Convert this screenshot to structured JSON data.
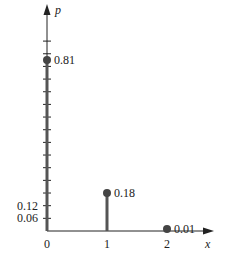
{
  "chart_data": {
    "type": "stem",
    "title": "",
    "xlabel": "x",
    "ylabel": "p",
    "x": [
      0,
      1,
      2
    ],
    "values": [
      0.81,
      0.18,
      0.01
    ],
    "value_labels": [
      "0.81",
      "0.18",
      "0.01"
    ],
    "x_tick_labels": [
      "0",
      "1",
      "2"
    ],
    "y_tick_labels": [
      "0.06",
      "0.12"
    ],
    "y_tick_step": 0.06,
    "ylim": [
      0,
      0.95
    ],
    "grid": false,
    "legend": null
  },
  "colors": {
    "axis": "#222222",
    "stem": "#555555",
    "dot": "#444444"
  }
}
